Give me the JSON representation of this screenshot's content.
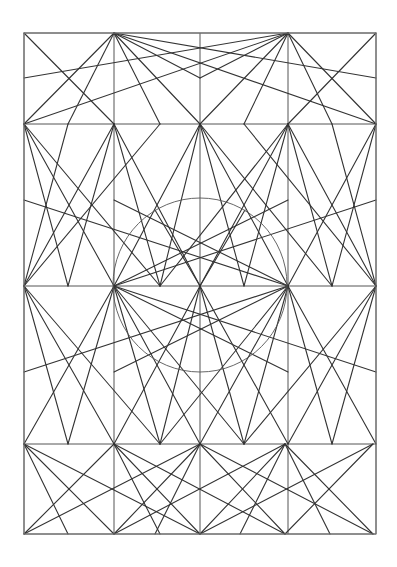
{
  "drawing": {
    "title": "Geometric construction drawing",
    "stroke_color": "#333333",
    "background": "#ffffff",
    "frame": {
      "x1": 24,
      "y1": 33,
      "x2": 376,
      "y2": 534
    },
    "columns_x": [
      24,
      114,
      200,
      288,
      376
    ],
    "rows_y": [
      33,
      124,
      286,
      444,
      534
    ],
    "circle": {
      "cx": 200,
      "cy": 285,
      "r": 87
    },
    "lines": [
      [
        24,
        33,
        114,
        124
      ],
      [
        114,
        33,
        24,
        124
      ],
      [
        114,
        33,
        200,
        124
      ],
      [
        114,
        33,
        376,
        124
      ],
      [
        114,
        33,
        376,
        78
      ],
      [
        114,
        33,
        160,
        124
      ],
      [
        114,
        33,
        68,
        124
      ],
      [
        114,
        33,
        200,
        78
      ],
      [
        288,
        33,
        200,
        124
      ],
      [
        288,
        33,
        376,
        124
      ],
      [
        288,
        33,
        24,
        124
      ],
      [
        288,
        33,
        24,
        78
      ],
      [
        288,
        33,
        244,
        124
      ],
      [
        288,
        33,
        332,
        124
      ],
      [
        376,
        33,
        288,
        124
      ],
      [
        288,
        33,
        200,
        78
      ],
      [
        24,
        124,
        114,
        286
      ],
      [
        24,
        124,
        68,
        286
      ],
      [
        114,
        124,
        24,
        286
      ],
      [
        114,
        124,
        68,
        286
      ],
      [
        24,
        124,
        160,
        286
      ],
      [
        114,
        124,
        160,
        286
      ],
      [
        200,
        124,
        114,
        286
      ],
      [
        200,
        124,
        160,
        286
      ],
      [
        114,
        124,
        200,
        286
      ],
      [
        200,
        124,
        288,
        286
      ],
      [
        200,
        124,
        244,
        286
      ],
      [
        288,
        124,
        200,
        286
      ],
      [
        288,
        124,
        244,
        286
      ],
      [
        376,
        124,
        288,
        286
      ],
      [
        376,
        124,
        332,
        286
      ],
      [
        288,
        124,
        376,
        286
      ],
      [
        288,
        124,
        332,
        286
      ],
      [
        200,
        124,
        332,
        286
      ],
      [
        288,
        124,
        160,
        286
      ],
      [
        24,
        286,
        68,
        124
      ],
      [
        24,
        286,
        160,
        124
      ],
      [
        376,
        286,
        332,
        124
      ],
      [
        376,
        286,
        244,
        124
      ],
      [
        114,
        286,
        376,
        200
      ],
      [
        114,
        286,
        376,
        372
      ],
      [
        288,
        286,
        24,
        200
      ],
      [
        288,
        286,
        24,
        372
      ],
      [
        114,
        286,
        288,
        200
      ],
      [
        288,
        286,
        114,
        200
      ],
      [
        114,
        286,
        288,
        372
      ],
      [
        288,
        286,
        114,
        372
      ],
      [
        200,
        286,
        155,
        210
      ],
      [
        200,
        286,
        245,
        210
      ],
      [
        114,
        286,
        24,
        444
      ],
      [
        114,
        286,
        68,
        444
      ],
      [
        24,
        286,
        114,
        444
      ],
      [
        24,
        286,
        68,
        444
      ],
      [
        114,
        286,
        160,
        444
      ],
      [
        24,
        286,
        160,
        444
      ],
      [
        114,
        286,
        200,
        444
      ],
      [
        200,
        286,
        114,
        444
      ],
      [
        200,
        286,
        160,
        444
      ],
      [
        200,
        286,
        244,
        444
      ],
      [
        200,
        286,
        288,
        444
      ],
      [
        288,
        286,
        200,
        444
      ],
      [
        288,
        286,
        244,
        444
      ],
      [
        288,
        286,
        376,
        444
      ],
      [
        376,
        286,
        288,
        444
      ],
      [
        376,
        286,
        332,
        444
      ],
      [
        288,
        286,
        332,
        444
      ],
      [
        376,
        286,
        244,
        444
      ],
      [
        288,
        286,
        160,
        444
      ],
      [
        114,
        286,
        244,
        444
      ],
      [
        24,
        444,
        114,
        534
      ],
      [
        114,
        444,
        24,
        534
      ],
      [
        24,
        444,
        68,
        534
      ],
      [
        114,
        444,
        160,
        534
      ],
      [
        114,
        444,
        200,
        534
      ],
      [
        200,
        444,
        114,
        534
      ],
      [
        114,
        444,
        285,
        534
      ],
      [
        285,
        444,
        114,
        534
      ],
      [
        200,
        444,
        285,
        534
      ],
      [
        285,
        444,
        200,
        534
      ],
      [
        285,
        444,
        373,
        534
      ],
      [
        373,
        444,
        285,
        534
      ],
      [
        24,
        444,
        200,
        534
      ],
      [
        373,
        444,
        200,
        534
      ],
      [
        200,
        444,
        24,
        534
      ],
      [
        200,
        444,
        373,
        534
      ],
      [
        200,
        444,
        155,
        534
      ],
      [
        285,
        444,
        240,
        534
      ],
      [
        285,
        444,
        330,
        534
      ]
    ]
  }
}
